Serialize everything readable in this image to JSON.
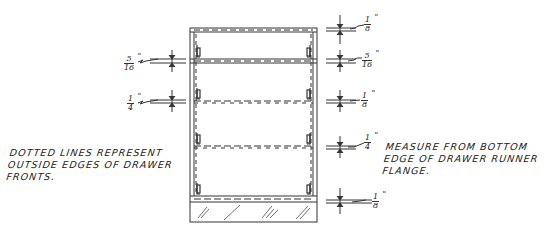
{
  "diagram": {
    "type": "cabinet drawer-runner placement detail (front elevation)",
    "notes": {
      "left": [
        "Dotted Lines Represent",
        "Outside Edges of Drawer",
        "Fronts."
      ],
      "right": [
        "Measure From Bottom",
        "Edge of Drawer Runner",
        "Flange."
      ]
    },
    "dimensions": {
      "top_right": {
        "num": "1",
        "den": "8",
        "unit": "\""
      },
      "upper_right": {
        "num": "5",
        "den": "16",
        "unit": "\""
      },
      "upper_left": {
        "num": "5",
        "den": "16",
        "unit": "\""
      },
      "middle_left": {
        "num": "1",
        "den": "4",
        "unit": "\""
      },
      "middle_right": {
        "num": "1",
        "den": "8",
        "unit": "\""
      },
      "lower_right": {
        "num": "1",
        "den": "4",
        "unit": "\""
      },
      "bottom_right": {
        "num": "1",
        "den": "8",
        "unit": "\""
      }
    },
    "colors": {
      "line": "#333333",
      "background": "#ffffff"
    }
  }
}
